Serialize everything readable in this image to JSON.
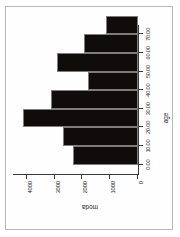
{
  "figure": {
    "frame_color": "#b9b9b9",
    "background": "#ffffff",
    "rotation_note": "landscape figure printed on portrait page"
  },
  "chart_data": {
    "type": "bar",
    "title": "",
    "xlabel": "age",
    "ylabel": "moda",
    "categories": [
      "0.00",
      "10.00",
      "20.00",
      "30.00",
      "40.00",
      "50.00",
      "60.00",
      "70.00"
    ],
    "x": [
      0,
      10,
      20,
      30,
      40,
      50,
      60,
      70
    ],
    "values": [
      2350,
      2700,
      4150,
      3150,
      1800,
      2900,
      1950,
      1150
    ],
    "xlim": [
      -5,
      75
    ],
    "ylim": [
      0,
      4500
    ],
    "xticks": [
      0,
      10,
      20,
      30,
      40,
      50,
      60,
      70
    ],
    "xticklabels": [
      "0.00",
      "10.00",
      "20.00",
      "30.00",
      "40.00",
      "50.00",
      "60.00",
      "70.00"
    ],
    "yticks": [
      0,
      1000,
      2000,
      3000,
      4000
    ],
    "yticklabels": [
      "0",
      "1000",
      "2000",
      "3000",
      "4000"
    ],
    "grid": false,
    "legend": null,
    "bar_color": "#100c0c",
    "bar_edge_color": "#7d7d7d"
  }
}
